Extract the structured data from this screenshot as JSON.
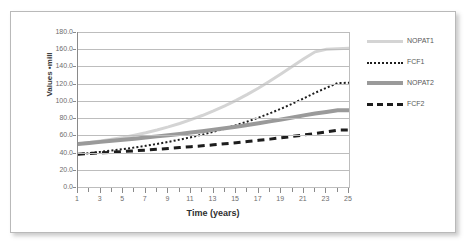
{
  "chart_data": {
    "type": "line",
    "title": "",
    "xlabel": "Time (years)",
    "ylabel": "Values ▪mill",
    "xlim": [
      1,
      25
    ],
    "ylim": [
      0,
      180
    ],
    "grid": true,
    "legend_position": "right",
    "y_ticks": [
      "180.0",
      "160.0",
      "140.0",
      "120.0",
      "100.0",
      "80.0",
      "60.0",
      "40.0",
      "20.0",
      "0.0"
    ],
    "y_tick_values": [
      180,
      160,
      140,
      120,
      100,
      80,
      60,
      40,
      20,
      0
    ],
    "x_ticks": [
      "1",
      "3",
      "5",
      "7",
      "9",
      "11",
      "13",
      "15",
      "17",
      "19",
      "21",
      "23",
      "25"
    ],
    "x_tick_values": [
      1,
      3,
      5,
      7,
      9,
      11,
      13,
      15,
      17,
      19,
      21,
      23,
      25
    ],
    "x": [
      1,
      2,
      3,
      4,
      5,
      6,
      7,
      8,
      9,
      10,
      11,
      12,
      13,
      14,
      15,
      16,
      17,
      18,
      19,
      20,
      21,
      22,
      23,
      24,
      25
    ],
    "series": [
      {
        "name": "NOPAT1",
        "style": "solid",
        "color": "#d4d4d4",
        "width": 3,
        "values": [
          50.0,
          51.6,
          53.4,
          55.4,
          57.6,
          60.2,
          63.0,
          66.2,
          69.8,
          73.8,
          78.2,
          83.0,
          88.4,
          94.2,
          100.6,
          107.6,
          115.0,
          123.0,
          131.4,
          140.2,
          149.0,
          157.0,
          160.0,
          160.5,
          161.0
        ]
      },
      {
        "name": "FCF1",
        "style": "dotted",
        "color": "#1d1d1d",
        "width": 2,
        "values": [
          38.0,
          39.4,
          40.8,
          42.4,
          44.0,
          45.8,
          47.8,
          50.0,
          52.4,
          55.0,
          57.8,
          60.8,
          64.2,
          67.8,
          71.8,
          76.0,
          80.6,
          85.6,
          91.0,
          96.8,
          103.0,
          109.4,
          115.2,
          120.8,
          121.0
        ]
      },
      {
        "name": "NOPAT2",
        "style": "solid",
        "color": "#9a9a9a",
        "width": 4,
        "values": [
          50.0,
          51.2,
          52.4,
          53.6,
          54.8,
          56.0,
          57.4,
          58.8,
          60.2,
          61.6,
          63.2,
          64.8,
          66.4,
          68.2,
          70.0,
          72.0,
          74.0,
          76.2,
          78.4,
          80.8,
          83.2,
          85.4,
          87.2,
          89.0,
          89.2
        ]
      },
      {
        "name": "FCF2",
        "style": "dashed",
        "color": "#1d1d1d",
        "width": 3,
        "values": [
          38.0,
          38.8,
          39.6,
          40.4,
          41.2,
          42.0,
          42.8,
          43.8,
          44.8,
          45.8,
          46.8,
          47.8,
          49.0,
          50.2,
          51.4,
          52.8,
          54.2,
          55.6,
          57.2,
          58.8,
          60.4,
          62.2,
          64.0,
          66.0,
          66.2
        ]
      }
    ]
  },
  "axis": {
    "y_title": "Values ▪mill",
    "x_title": "Time (years)"
  },
  "legend": {
    "items": [
      {
        "label": "NOPAT1",
        "swatch": "solid-light-line-icon"
      },
      {
        "label": "FCF1",
        "swatch": "dotted-line-icon"
      },
      {
        "label": "NOPAT2",
        "swatch": "solid-mid-line-icon"
      },
      {
        "label": "FCF2",
        "swatch": "dashed-line-icon"
      }
    ]
  }
}
